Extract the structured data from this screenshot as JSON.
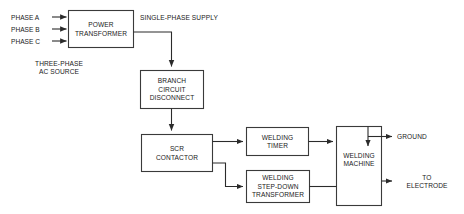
{
  "diagram": {
    "background_color": "#ffffff",
    "line_color": "#2b2b2b",
    "box_stroke_color": "#3a3a3a",
    "box_fill_color": "#ffffff",
    "text_color": "#1a1a1a",
    "boxes": [
      {
        "id": "power-transformer",
        "label": "POWER\nTRANSFORMER"
      },
      {
        "id": "branch-circuit-disconnect",
        "label": "BRANCH\nCIRCUIT\nDISCONNECT"
      },
      {
        "id": "scr-contactor",
        "label": "SCR\nCONTACTOR"
      },
      {
        "id": "welding-timer",
        "label": "WELDING\nTIMER"
      },
      {
        "id": "welding-step-down-transformer",
        "label": "WELDING\nSTEP-DOWN\nTRANSFORMER"
      },
      {
        "id": "welding-machine",
        "label": "WELDING\nMACHINE"
      }
    ],
    "input_labels": [
      {
        "id": "phase-a",
        "text": "PHASE A"
      },
      {
        "id": "phase-b",
        "text": "PHASE B"
      },
      {
        "id": "phase-c",
        "text": "PHASE C"
      }
    ],
    "free_labels": [
      {
        "id": "three-phase-ac-source",
        "text": "THREE-PHASE\nAC SOURCE"
      },
      {
        "id": "single-phase-supply",
        "text": "SINGLE-PHASE SUPPLY"
      },
      {
        "id": "ground",
        "text": "GROUND"
      },
      {
        "id": "to-electrode",
        "text": "TO\nELECTRODE"
      }
    ]
  }
}
